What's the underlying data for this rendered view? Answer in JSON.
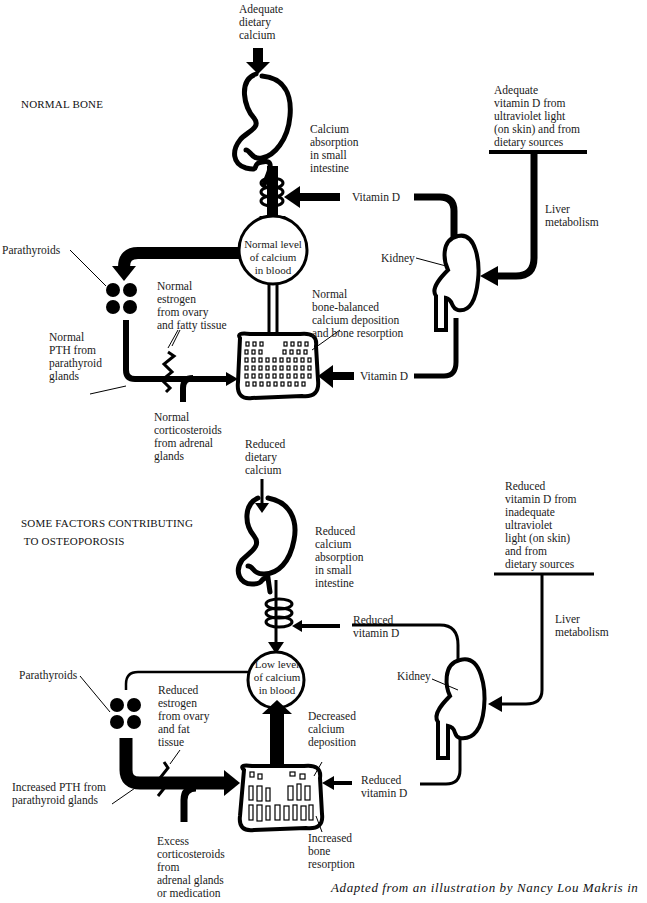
{
  "panels": {
    "normal": {
      "title": "NORMAL BONE",
      "dietary_calcium": "Adequate\ndietary\ncalcium",
      "absorption": "Calcium\nabsorption\nin small\nintestine",
      "vitamin_d_source": "Adequate\nvitamin D from\nultraviolet light\n(on skin) and from\ndietary sources",
      "liver": "Liver\nmetabolism",
      "vitamin_d_upper": "Vitamin D",
      "vitamin_d_lower": "Vitamin D",
      "kidney": "Kidney",
      "blood": "Normal level\nof calcium\nin blood",
      "bone_balance": "Normal\nbone-balanced\ncalcium deposition\nand bone resorption",
      "parathyroids": "Parathyroids",
      "estrogen": "Normal\nestrogen\nfrom ovary\nand fatty tissue",
      "pth": "Normal\nPTH from\nparathyroid\nglands",
      "corticosteroids": "Normal\ncorticosteroids\nfrom adrenal\nglands"
    },
    "osteoporosis": {
      "title": "SOME FACTORS CONTRIBUTING\n TO OSTEOPOROSIS",
      "dietary_calcium": "Reduced\ndietary\ncalcium",
      "absorption": "Reduced\ncalcium\nabsorption\nin small\nintestine",
      "vitamin_d_source": "Reduced\nvitamin D from\ninadequate\nultraviolet\nlight (on skin)\nand from\ndietary sources",
      "liver": "Liver\nmetabolism",
      "vitamin_d_upper": "Reduced\nvitamin D",
      "vitamin_d_lower": "Reduced\nvitamin D",
      "kidney": "Kidney",
      "blood": "Low level\nof calcium\nin blood",
      "deposition": "Decreased\ncalcium\ndeposition",
      "resorption": "Increased\nbone\nresorption",
      "parathyroids": "Parathyroids",
      "estrogen": "Reduced\nestrogen\nfrom ovary\nand fat\ntissue",
      "pth": "Increased PTH from\nparathyroid glands",
      "corticosteroids": "Excess\ncorticosteroids\nfrom\nadrenal glands\nor medication"
    }
  },
  "caption": "Adapted from an illustration by Nancy Lou Makris in"
}
